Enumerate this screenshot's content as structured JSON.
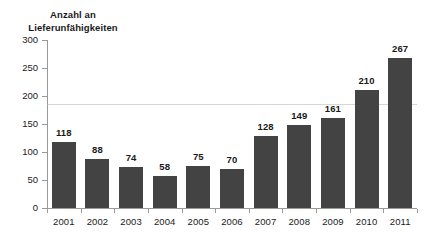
{
  "chart_data": {
    "type": "bar",
    "title": "Anzahl an\nLieferunfähigkeiten",
    "title_line1": "Anzahl an",
    "title_line2": "Lieferunfähigkeiten",
    "xlabel": "",
    "ylabel": "",
    "categories": [
      "2001",
      "2002",
      "2003",
      "2004",
      "2005",
      "2006",
      "2007",
      "2008",
      "2009",
      "2010",
      "2011"
    ],
    "values": [
      118,
      88,
      74,
      58,
      75,
      70,
      128,
      149,
      161,
      210,
      267
    ],
    "value_labels": [
      "118",
      "88",
      "74",
      "58",
      "75",
      "70",
      "128",
      "149",
      "161",
      "210",
      "267"
    ],
    "ylim": [
      0,
      300
    ],
    "yticks": [
      0,
      50,
      100,
      150,
      200,
      250,
      300
    ],
    "ytick_labels": [
      "0",
      "50",
      "100",
      "150",
      "200",
      "250",
      "300"
    ],
    "grid": "single-faint-horizontal",
    "gridline_value": 185,
    "legend": "none",
    "bar_color": "#434343",
    "axis_color": "#9a9a9a",
    "text_color": "#1a1a1a",
    "background_color": "#ffffff"
  }
}
